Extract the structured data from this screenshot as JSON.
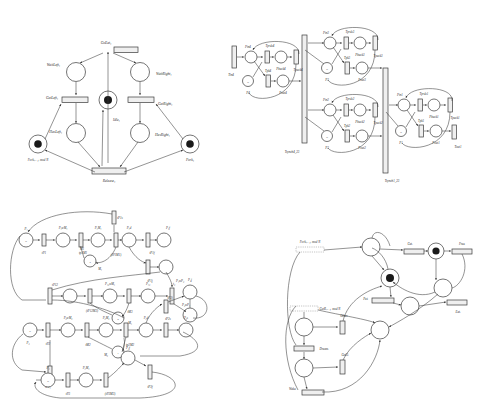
{
  "figure": {
    "background": "#ffffff",
    "stroke_color": "#3a3a3a",
    "token_color": "#1a1a1a",
    "transition_fill": "#efefef"
  },
  "diagrams": [
    {
      "id": "philosophers-classic",
      "name": "Dining philosopher (classic)",
      "position": "top-left",
      "places": [
        {
          "id": "waitleft",
          "label": "WaitLeft₁",
          "tokens": 0
        },
        {
          "id": "waitright",
          "label": "WaitRight₁",
          "tokens": 0
        },
        {
          "id": "idle",
          "label": "Idle₁",
          "tokens": 1
        },
        {
          "id": "hasleft",
          "label": "HasLeft₁",
          "tokens": 0
        },
        {
          "id": "hasright",
          "label": "HasRight₁",
          "tokens": 0
        },
        {
          "id": "forkleft",
          "label": "Fork₍ᵢ₊₁₎ mod N",
          "tokens": 1
        },
        {
          "id": "forkright",
          "label": "Fork₁",
          "tokens": 1
        }
      ],
      "transitions": [
        {
          "id": "goeat",
          "label": "GoEat₁"
        },
        {
          "id": "getleft",
          "label": "GetLeft₁"
        },
        {
          "id": "getright",
          "label": "GetRight₁"
        },
        {
          "id": "release",
          "label": "Release₁"
        }
      ]
    },
    {
      "id": "producer-sync",
      "name": "Synchronised producer cells",
      "position": "top-right",
      "cells": [
        {
          "index": "4",
          "place_in": "Pin4",
          "t_prod": "Tprdc4",
          "place_back": "Pback4",
          "t_pack": "Tpack4",
          "place_n": "N",
          "place_p": "P4",
          "t_pk": "Tpk4",
          "place_out": "Pout4"
        },
        {
          "index": "3",
          "place_in": "Pin3",
          "t_prod": "Tprdc3",
          "place_back": "Pback3",
          "t_pack": "Tpack3",
          "place_n": "N",
          "place_p": "P3",
          "t_pk": "Tpk3",
          "place_out": "Pout3"
        },
        {
          "index": "2",
          "place_in": "Pin2",
          "t_prod": "Tprdc2",
          "place_back": "Pback2",
          "t_pack": "Tpack2",
          "place_n": "N",
          "place_p": "P2",
          "t_pk": "Tpk2",
          "place_out": "Pout2"
        },
        {
          "index": "1",
          "place_in": "Pin1",
          "t_prod": "Tprdc1",
          "place_back": "Pback1",
          "t_pack": "Tpack1",
          "place_n": "N",
          "place_p": "P1",
          "t_pk": "Tpk1",
          "place_out": "Pout1",
          "t_out": "Tout1"
        }
      ],
      "sync_bars": [
        {
          "id": "sync4",
          "label": "Tsynch4_23"
        },
        {
          "id": "sync1",
          "label": "Tsynch1_23"
        }
      ]
    },
    {
      "id": "manufacturing",
      "name": "Flexible manufacturing system",
      "position": "bottom-left",
      "places": [
        {
          "id": "p1",
          "label": "P₁",
          "tokens": "N"
        },
        {
          "id": "p1wm1",
          "label": "P₁wM₁",
          "tokens": 0
        },
        {
          "id": "p1m1",
          "label": "P₁M₁",
          "tokens": 0
        },
        {
          "id": "m1",
          "label": "M₁",
          "tokens": 3
        },
        {
          "id": "p1d",
          "label": "P₁d",
          "tokens": 0
        },
        {
          "id": "p1f",
          "label": "P₁f",
          "tokens": 0
        },
        {
          "id": "p1wp2",
          "label": "P₁wP₂",
          "tokens": 0
        },
        {
          "id": "p12wm3",
          "label": "P₁₂wM₃",
          "tokens": 0
        },
        {
          "id": "p12",
          "label": "P₁₂",
          "tokens": 0
        },
        {
          "id": "p2wp1",
          "label": "P₂wP₁",
          "tokens": 0
        },
        {
          "id": "m3",
          "label": "M₃",
          "tokens": 2
        },
        {
          "id": "p2",
          "label": "P₂",
          "tokens": "S"
        },
        {
          "id": "p2wm2",
          "label": "P₂wM₂",
          "tokens": 0
        },
        {
          "id": "p2m2",
          "label": "P₂M₂",
          "tokens": 0
        },
        {
          "id": "m2",
          "label": "M₂",
          "tokens": 1
        },
        {
          "id": "p2d",
          "label": "P₂d",
          "tokens": 0
        },
        {
          "id": "p2s",
          "label": "P₂s",
          "tokens": 0
        },
        {
          "id": "p2j",
          "label": "P₂j",
          "tokens": 0
        },
        {
          "id": "p3",
          "label": "P₃",
          "tokens": "N"
        },
        {
          "id": "p3m3",
          "label": "P₃M₃",
          "tokens": 0
        },
        {
          "id": "p3f",
          "label": "P₃f",
          "tokens": 0
        }
      ],
      "transitions": [
        {
          "id": "tp1",
          "label": "tP1"
        },
        {
          "id": "tp1m1",
          "label": "tp1M1"
        },
        {
          "id": "tp1m1b",
          "label": "(tP1M1)"
        },
        {
          "id": "tp1s",
          "label": "tP1s"
        },
        {
          "id": "tp1f",
          "label": "tP1f"
        },
        {
          "id": "tp1j",
          "label": "tP1j"
        },
        {
          "id": "tp12",
          "label": "tP12"
        },
        {
          "id": "tp12m3",
          "label": "(tP12M3)"
        },
        {
          "id": "tm3",
          "label": "tM3"
        },
        {
          "id": "t2",
          "label": "t₂"
        },
        {
          "id": "tp2",
          "label": "tP2"
        },
        {
          "id": "tp2m2",
          "label": "tp2M2"
        },
        {
          "id": "tm2",
          "label": "tM2"
        },
        {
          "id": "tp2b",
          "label": "tP2₁"
        },
        {
          "id": "tp3",
          "label": "tP3"
        },
        {
          "id": "tp3m3",
          "label": "(tP3M3)"
        },
        {
          "id": "tp3f",
          "label": "tP3f"
        }
      ]
    },
    {
      "id": "philosophers-extended",
      "name": "Dining philosopher (extended)",
      "position": "bottom-right",
      "places": [
        {
          "id": "fork_next",
          "label": "Fork₍ᵢ₊₁₎ mod N",
          "tokens": 1
        },
        {
          "id": "fork_i",
          "label": "Forkᵢ",
          "tokens": 1
        },
        {
          "id": "eat_place",
          "label": "",
          "tokens": 1
        },
        {
          "id": "mid_place",
          "label": "",
          "tokens": 0
        },
        {
          "id": "other_place",
          "label": "",
          "tokens": 0
        },
        {
          "id": "dream_place",
          "label": "",
          "tokens": 0
        }
      ],
      "transitions": [
        {
          "id": "get",
          "label": "Getᵢ"
        },
        {
          "id": "put",
          "label": "Putᵢ"
        },
        {
          "id": "free",
          "label": "Freeᵢ"
        },
        {
          "id": "eat",
          "label": "Eatᵢ"
        },
        {
          "id": "other",
          "label": "Otherᵢ"
        },
        {
          "id": "dream",
          "label": "Dreamᵢ"
        },
        {
          "id": "getr",
          "label": "GetR₍ᵢ₊₁₎ mod N"
        },
        {
          "id": "geto",
          "label": "GetOᵢ"
        },
        {
          "id": "wake",
          "label": "Wakeᵢ"
        }
      ]
    }
  ]
}
